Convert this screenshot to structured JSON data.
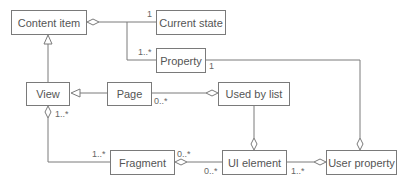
{
  "diagram": {
    "type": "uml-class",
    "classes": {
      "content_item": "Content item",
      "current_state": "Current state",
      "property": "Property",
      "view": "View",
      "page": "Page",
      "used_by_list": "Used by list",
      "fragment": "Fragment",
      "ui_element": "UI element",
      "user_property": "User property"
    },
    "multiplicities": {
      "current_state": "1",
      "property_left": "1..*",
      "property_right": "1",
      "page_used": "0..*",
      "view_fragment": "1..*",
      "fragment_view": "1..*",
      "fragment_ui": "0..*",
      "ui_fragment": "0..*",
      "ui_user": "1..*"
    },
    "relationships": [
      {
        "from": "Content item",
        "to": "Current state",
        "kind": "aggregation",
        "mult": "1"
      },
      {
        "from": "Content item",
        "to": "Property",
        "kind": "aggregation",
        "mult": "1..*"
      },
      {
        "from": "View",
        "to": "Content item",
        "kind": "generalization"
      },
      {
        "from": "Page",
        "to": "View",
        "kind": "generalization"
      },
      {
        "from": "Used by list",
        "to": "Page",
        "kind": "aggregation",
        "mult": "0..*"
      },
      {
        "from": "View",
        "to": "Fragment",
        "kind": "aggregation",
        "mult": "1..*"
      },
      {
        "from": "Fragment",
        "to": "UI element",
        "kind": "aggregation",
        "mult": "0..*"
      },
      {
        "from": "UI element",
        "to": "Used by list",
        "kind": "aggregation"
      },
      {
        "from": "User property",
        "to": "UI element",
        "kind": "aggregation",
        "mult": "1..*"
      },
      {
        "from": "User property",
        "to": "Property",
        "kind": "aggregation",
        "mult": "1"
      }
    ]
  }
}
